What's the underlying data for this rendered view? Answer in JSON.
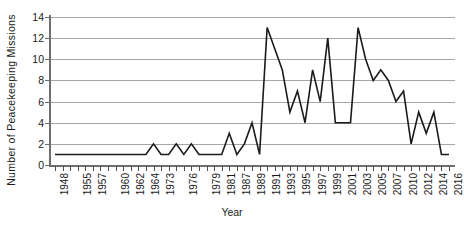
{
  "chart_data": {
    "type": "line",
    "title": "",
    "xlabel": "Year",
    "ylabel": "Number of Peacekeeping Missions",
    "ylim": [
      0,
      14
    ],
    "yticks": [
      0,
      2,
      4,
      6,
      8,
      10,
      12,
      14
    ],
    "grid": true,
    "legend": false,
    "x": [
      "1948",
      "1949",
      "1950",
      "1955",
      "1956",
      "1957",
      "1958",
      "1959",
      "1960",
      "1961",
      "1962",
      "1963",
      "1964",
      "1965",
      "1973",
      "1974",
      "1975",
      "1976",
      "1977",
      "1978",
      "1979",
      "1980",
      "1981",
      "1982",
      "1987",
      "1988",
      "1989",
      "1990",
      "1991",
      "1992",
      "1993",
      "1994",
      "1995",
      "1996",
      "1997",
      "1998",
      "1999",
      "2000",
      "2001",
      "2002",
      "2003",
      "2004",
      "2005",
      "2006",
      "2007",
      "2008",
      "2010",
      "2011",
      "2012",
      "2013",
      "2014",
      "2015",
      "2016"
    ],
    "tick_labels": [
      "1948",
      "",
      "",
      "1955",
      "",
      "1957",
      "",
      "",
      "1960",
      "",
      "1962",
      "",
      "1964",
      "",
      "1973",
      "",
      "",
      "1976",
      "",
      "",
      "1979",
      "",
      "1981",
      "",
      "1987",
      "",
      "1989",
      "",
      "1991",
      "",
      "1993",
      "",
      "1995",
      "",
      "1997",
      "",
      "1999",
      "",
      "2001",
      "",
      "2003",
      "",
      "2005",
      "",
      "2007",
      "",
      "2010",
      "",
      "2012",
      "",
      "2014",
      "",
      "2016"
    ],
    "values": [
      1,
      1,
      1,
      1,
      1,
      1,
      1,
      1,
      1,
      1,
      1,
      1,
      1,
      2,
      1,
      1,
      2,
      1,
      2,
      1,
      1,
      1,
      1,
      3,
      1,
      2,
      4,
      1,
      13,
      11,
      9,
      5,
      7,
      4,
      9,
      6,
      12,
      4,
      4,
      4,
      13,
      10,
      8,
      9,
      8,
      6,
      7,
      2,
      5,
      3,
      5,
      1,
      1
    ],
    "line_color": "#1a1a1a",
    "line_width": 1.6
  }
}
